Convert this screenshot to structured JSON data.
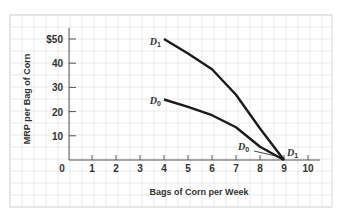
{
  "chart_data": {
    "type": "line",
    "title": "",
    "xlabel": "Bags of Corn per Week",
    "ylabel": "MRP per Bag of Corn",
    "xlim": [
      0,
      10
    ],
    "ylim": [
      0,
      50
    ],
    "x_ticks": [
      "0",
      "1",
      "2",
      "3",
      "4",
      "5",
      "6",
      "7",
      "8",
      "9",
      "10"
    ],
    "y_ticks": [
      "10",
      "20",
      "30",
      "40",
      "$50"
    ],
    "grid": true,
    "legend": "none (curves labeled directly)",
    "series": [
      {
        "name": "D1",
        "label_main": "D",
        "label_sub": "1",
        "points": [
          [
            4,
            50
          ],
          [
            5,
            44
          ],
          [
            6,
            37.5
          ],
          [
            7,
            27
          ],
          [
            8,
            13
          ],
          [
            9,
            0
          ]
        ]
      },
      {
        "name": "D0",
        "label_main": "D",
        "label_sub": "0",
        "points": [
          [
            4,
            25
          ],
          [
            5,
            22
          ],
          [
            6,
            18.5
          ],
          [
            7,
            13.5
          ],
          [
            8,
            5.5
          ],
          [
            9,
            0
          ]
        ]
      }
    ],
    "annotations": [
      {
        "text": "D0",
        "x": 8,
        "y": 5,
        "note": "label with leader line pointing to D0 end at (9,0)"
      },
      {
        "text": "D1",
        "x": 9.3,
        "y": 1,
        "note": "label at D1 end at (9,0)"
      }
    ]
  },
  "colors": {
    "grid": "#e2e2e2",
    "axis": "#555555",
    "curve": "#1a1a1a",
    "text": "#333333"
  }
}
